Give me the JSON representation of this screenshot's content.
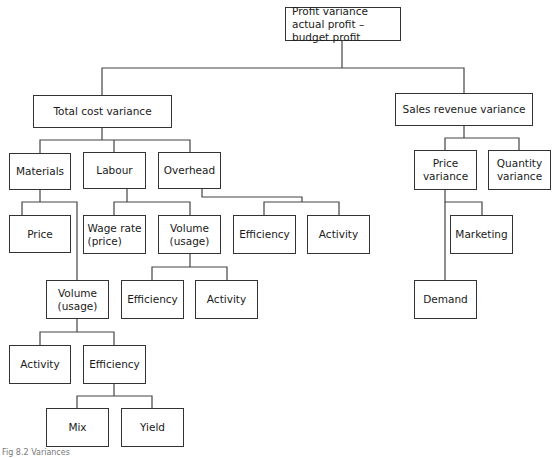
{
  "diagram": {
    "type": "tree",
    "root": {
      "label": "Profit variance\nactual profit – budget profit",
      "children": [
        "total_cost",
        "sales_revenue"
      ]
    },
    "nodes": {
      "profit": {
        "label": "Profit variance\nactual profit – budget profit"
      },
      "total_cost": {
        "label": "Total cost variance"
      },
      "sales_revenue": {
        "label": "Sales revenue variance"
      },
      "materials": {
        "label": "Materials"
      },
      "labour": {
        "label": "Labour"
      },
      "overhead": {
        "label": "Overhead"
      },
      "mat_price": {
        "label": "Price"
      },
      "mat_volume": {
        "label": "Volume\n(usage)"
      },
      "mat_activity": {
        "label": "Activity"
      },
      "mat_efficiency": {
        "label": "Efficiency"
      },
      "mix": {
        "label": "Mix"
      },
      "yield": {
        "label": "Yield"
      },
      "wage_rate": {
        "label": "Wage rate\n(price)"
      },
      "lab_volume": {
        "label": "Volume\n(usage)"
      },
      "lab_efficiency": {
        "label": "Efficiency"
      },
      "lab_activity": {
        "label": "Activity"
      },
      "oh_efficiency": {
        "label": "Efficiency"
      },
      "oh_activity": {
        "label": "Activity"
      },
      "price_variance": {
        "label": "Price\nvariance"
      },
      "quantity_variance": {
        "label": "Quantity\nvariance"
      },
      "marketing": {
        "label": "Marketing"
      },
      "demand": {
        "label": "Demand"
      }
    },
    "edges": [
      [
        "profit",
        "total_cost"
      ],
      [
        "profit",
        "sales_revenue"
      ],
      [
        "total_cost",
        "materials"
      ],
      [
        "total_cost",
        "labour"
      ],
      [
        "total_cost",
        "overhead"
      ],
      [
        "materials",
        "mat_price"
      ],
      [
        "materials",
        "mat_volume"
      ],
      [
        "mat_volume",
        "mat_activity"
      ],
      [
        "mat_volume",
        "mat_efficiency"
      ],
      [
        "mat_efficiency",
        "mix"
      ],
      [
        "mat_efficiency",
        "yield"
      ],
      [
        "labour",
        "wage_rate"
      ],
      [
        "labour",
        "lab_volume"
      ],
      [
        "lab_volume",
        "lab_efficiency"
      ],
      [
        "lab_volume",
        "lab_activity"
      ],
      [
        "overhead",
        "oh_efficiency"
      ],
      [
        "overhead",
        "oh_activity"
      ],
      [
        "sales_revenue",
        "price_variance"
      ],
      [
        "sales_revenue",
        "quantity_variance"
      ],
      [
        "price_variance",
        "marketing"
      ],
      [
        "price_variance",
        "demand"
      ]
    ],
    "caption": "Fig 8.2  Variances"
  }
}
